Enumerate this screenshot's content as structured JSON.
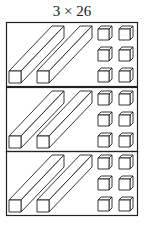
{
  "title": "3 × 26",
  "diagram": {
    "groups": 3,
    "tens_per_group": 2,
    "ones_per_group": 6,
    "stroke_color": "#222222",
    "background": "#ffffff"
  }
}
